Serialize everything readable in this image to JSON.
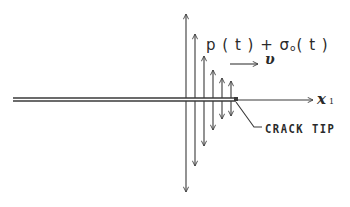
{
  "diagram": {
    "colors": {
      "ink": "#3a3a3a",
      "background": "#ffffff"
    },
    "crack": {
      "x_start": 13,
      "x_end": 236,
      "y_upper": 98,
      "y_lower": 101
    },
    "axis": {
      "x_start": 236,
      "x_end": 313,
      "y": 100
    },
    "arrows": [
      {
        "x": 186,
        "top": 14,
        "bottom": 192
      },
      {
        "x": 195,
        "top": 34,
        "bottom": 166
      },
      {
        "x": 204,
        "top": 56,
        "bottom": 146
      },
      {
        "x": 213,
        "top": 70,
        "bottom": 130
      },
      {
        "x": 222,
        "top": 78,
        "bottom": 119
      },
      {
        "x": 231,
        "top": 81,
        "bottom": 116
      }
    ],
    "velocity_arrow": {
      "x_start": 230,
      "x_end": 258,
      "y": 64
    },
    "leader_line": {
      "x1": 236,
      "y1": 102,
      "x2": 254,
      "y2": 127,
      "x3": 262,
      "y3": 127
    }
  },
  "labels": {
    "formula_main": "p ( t ) + σ",
    "formula_sub": "o",
    "formula_tail": "( t )",
    "velocity": "υ",
    "axis_main": "x",
    "axis_sub": "1",
    "crack_tip": "CRACK TIP"
  }
}
